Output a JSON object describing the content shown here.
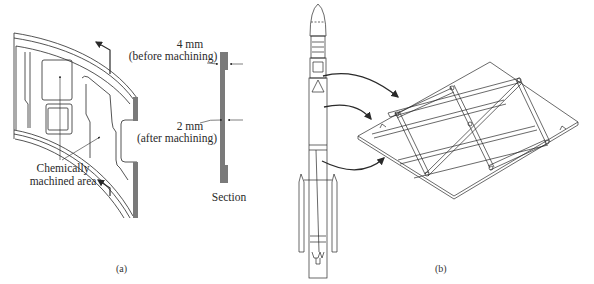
{
  "figure_a": {
    "caption": "(a)",
    "callout_area": "Chemically\nmachined area",
    "callout_area_line1": "Chemically",
    "callout_area_line2": "machined area",
    "section_label": "Section",
    "dimension_before": {
      "value": "4 mm",
      "note": "(before machining)"
    },
    "dimension_after": {
      "value": "2 mm",
      "note": "(after machining)"
    }
  },
  "figure_b": {
    "caption": "(b)",
    "subjects": [
      "launch-vehicle",
      "isogrid-panel"
    ]
  },
  "colors": {
    "line": "#2a2a2a",
    "section_fill": "#7a7a7a",
    "background": "#ffffff"
  }
}
